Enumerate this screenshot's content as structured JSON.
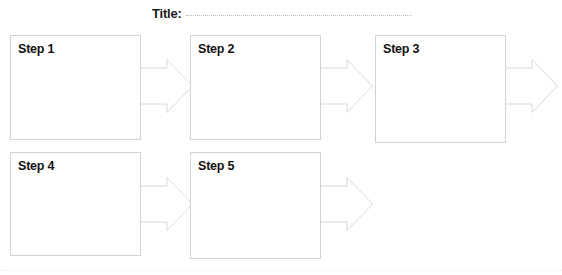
{
  "worksheet": {
    "background_color": "#ffffff",
    "box_border_color": "#d2d2d2",
    "arrow_border_color": "#d8d8d8",
    "text_color": "#111111"
  },
  "title": {
    "label": "Title:",
    "value": "",
    "rule_style": "dotted"
  },
  "steps": [
    {
      "label": "Step 1",
      "row": 1,
      "column": 1
    },
    {
      "label": "Step 2",
      "row": 1,
      "column": 2
    },
    {
      "label": "Step 3",
      "row": 1,
      "column": 3
    },
    {
      "label": "Step 4",
      "row": 2,
      "column": 1
    },
    {
      "label": "Step 5",
      "row": 2,
      "column": 2
    }
  ],
  "arrows": [
    {
      "name": "arrow-step1-to-step2",
      "from": "Step 1",
      "to": "Step 2"
    },
    {
      "name": "arrow-step2-to-step3",
      "from": "Step 2",
      "to": "Step 3"
    },
    {
      "name": "arrow-step3-out",
      "from": "Step 3",
      "to": ""
    },
    {
      "name": "arrow-step4-to-step5",
      "from": "Step 4",
      "to": "Step 5"
    },
    {
      "name": "arrow-step5-out",
      "from": "Step 5",
      "to": ""
    }
  ]
}
